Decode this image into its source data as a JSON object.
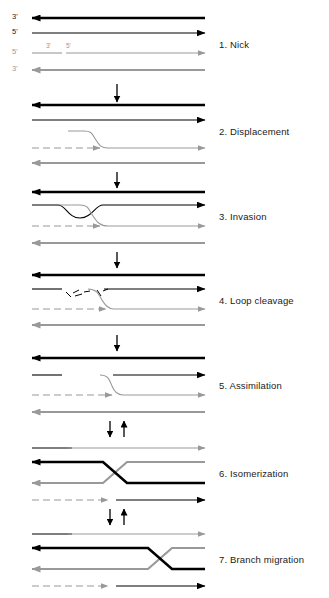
{
  "figure": {
    "width": 329,
    "height": 598,
    "background": "#ffffff"
  },
  "colors": {
    "dark_strand": "#000000",
    "light_strand": "#999999",
    "label_text": "#1a1a1a",
    "end_label_dark": "#222222",
    "end_label_light": "#999999",
    "arrow_transition": "#000000"
  },
  "steps": [
    {
      "number": "1.",
      "name": "Nick",
      "label": "1.  Nick"
    },
    {
      "number": "2.",
      "name": "Displacement",
      "label": "2.  Displacement"
    },
    {
      "number": "3.",
      "name": "Invasion",
      "label": "3.  Invasion"
    },
    {
      "number": "4.",
      "name": "Loop cleavage",
      "label": "4.  Loop cleavage"
    },
    {
      "number": "5.",
      "name": "Assimilation",
      "label": "5.  Assimilation"
    },
    {
      "number": "6.",
      "name": "Isomerization",
      "label": "6.  Isomerization"
    },
    {
      "number": "7.",
      "name": "Branch migration",
      "label": "7.  Branch migration"
    }
  ],
  "panel1_end_labels": {
    "strand1_left": "3'",
    "strand2_left": "5'",
    "strand3_left": "5'",
    "strand4_left": "3'"
  },
  "panel1_nick_labels": {
    "left_of_nick": "3'",
    "right_of_nick": "5'"
  },
  "transitions": [
    {
      "after_step": 1,
      "type": "single-down"
    },
    {
      "after_step": 2,
      "type": "single-down"
    },
    {
      "after_step": 3,
      "type": "single-down"
    },
    {
      "after_step": 4,
      "type": "single-down"
    },
    {
      "after_step": 5,
      "type": "double-reversible"
    },
    {
      "after_step": 6,
      "type": "double-reversible"
    }
  ]
}
